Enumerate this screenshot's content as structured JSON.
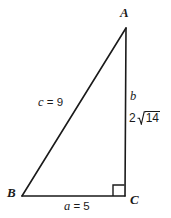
{
  "figure": {
    "type": "right-triangle-diagram",
    "background_color": "#ffffff",
    "stroke_color": "#1a1a1a",
    "vertices": {
      "a": {
        "label": "A",
        "x": 126,
        "y": 28
      },
      "b": {
        "label": "B",
        "x": 22,
        "y": 196
      },
      "c": {
        "label": "C",
        "x": 125,
        "y": 196
      }
    },
    "sides": {
      "c": {
        "label": "c = 9",
        "var": "c",
        "value": "9"
      },
      "a": {
        "label": "a = 5",
        "var": "a",
        "value": "5"
      },
      "b": {
        "var": "b",
        "coefficient": "2",
        "radicand": "14",
        "value": "2√14"
      }
    },
    "right_angle": {
      "at_vertex": "C",
      "marker": "square",
      "size": 11
    }
  }
}
